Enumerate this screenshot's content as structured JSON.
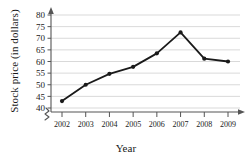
{
  "chart_data": {
    "type": "line",
    "title": "",
    "xlabel": "Year",
    "ylabel": "Stock price (in dollars)",
    "categories": [
      "2002",
      "2003",
      "2004",
      "2005",
      "2006",
      "2007",
      "2008",
      "2009"
    ],
    "values": [
      43,
      50,
      54.7,
      57.7,
      63.5,
      72.5,
      61.2,
      60
    ],
    "xtick_labels": [
      "2002",
      "2003",
      "2004",
      "2005",
      "2006",
      "2007",
      "2008",
      "2009"
    ],
    "ytick_labels": [
      "40",
      "45",
      "50",
      "55",
      "60",
      "65",
      "70",
      "75",
      "80"
    ],
    "ytick_values": [
      40,
      45,
      50,
      55,
      60,
      65,
      70,
      75,
      80
    ],
    "ylim": [
      40,
      80
    ],
    "grid": true,
    "grid_axis": "y",
    "legend": "none",
    "axis_break": true,
    "axis_break_symbol": "zigzag",
    "marker": "circle",
    "colors": {
      "line": "#1a1a1a",
      "marker": "#1a1a1a",
      "grid": "#c8c8c8",
      "axis": "#555555",
      "background": "#ffffff",
      "text": "#1a1a1a"
    }
  }
}
